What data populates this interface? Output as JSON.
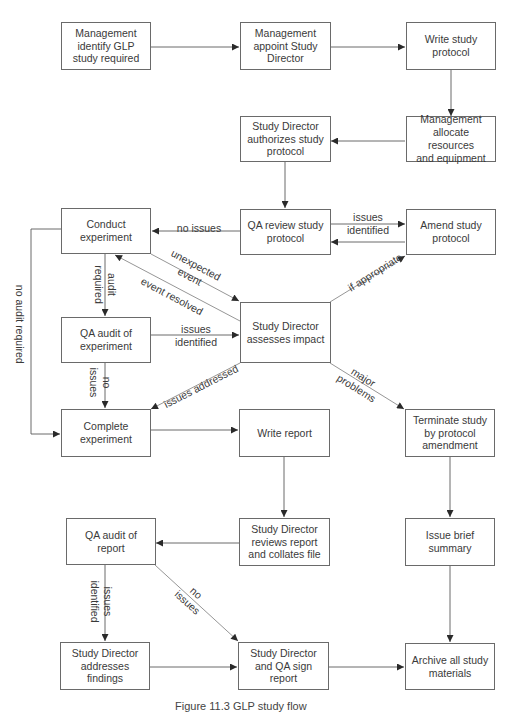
{
  "diagram": {
    "type": "flowchart",
    "title": "GLP study flow",
    "nodes": {
      "mgmt_identify": "Management\nidentify GLP\nstudy required",
      "mgmt_appoint": "Management\nappoint Study\nDirector",
      "write_protocol": "Write study\nprotocol",
      "mgmt_allocate": "Management\nallocate resources\nand equipment",
      "sd_authorizes": "Study Director\nauthorizes study\nprotocol",
      "qa_review": "QA review study\nprotocol",
      "amend_protocol": "Amend study\nprotocol",
      "conduct_experiment": "Conduct\nexperiment",
      "qa_audit_experiment": "QA audit of\nexperiment",
      "sd_assesses": "Study Director\nassesses impact",
      "complete_experiment": "Complete\nexperiment",
      "write_report": "Write report",
      "terminate_study": "Terminate study\nby protocol\namendment",
      "qa_audit_report": "QA audit of\nreport",
      "sd_reviews_report": "Study Director\nreviews report\nand collates file",
      "issue_summary": "Issue brief\nsummary",
      "sd_addresses": "Study Director\naddresses\nfindings",
      "sd_qa_sign": "Study Director\nand QA sign\nreport",
      "archive": "Archive all study\nmaterials"
    },
    "edge_labels": {
      "no_issues_review": "no issues",
      "issues_identified_review": "issues\nidentified",
      "audit_required": "audit\nrequired",
      "no_audit_required": "no audit required",
      "unexpected_event": "unexpected\nevent",
      "event_resolved": "event resolved",
      "if_appropriate": "if appropriate",
      "issues_identified_audit": "issues\nidentified",
      "no_issues_audit": "no\nissues",
      "issues_addressed": "issues addressed",
      "major_problems": "major\nproblems",
      "issues_identified_report": "issues\nidentified",
      "no_issues_report": "no\nissues"
    },
    "edges": [
      {
        "from": "mgmt_identify",
        "to": "mgmt_appoint"
      },
      {
        "from": "mgmt_appoint",
        "to": "write_protocol"
      },
      {
        "from": "write_protocol",
        "to": "mgmt_allocate"
      },
      {
        "from": "mgmt_allocate",
        "to": "sd_authorizes"
      },
      {
        "from": "sd_authorizes",
        "to": "qa_review"
      },
      {
        "from": "qa_review",
        "to": "amend_protocol",
        "label": "issues identified"
      },
      {
        "from": "amend_protocol",
        "to": "qa_review"
      },
      {
        "from": "qa_review",
        "to": "conduct_experiment",
        "label": "no issues"
      },
      {
        "from": "conduct_experiment",
        "to": "qa_audit_experiment",
        "label": "audit required"
      },
      {
        "from": "conduct_experiment",
        "to": "complete_experiment",
        "label": "no audit required"
      },
      {
        "from": "conduct_experiment",
        "to": "sd_assesses",
        "label": "unexpected event"
      },
      {
        "from": "sd_assesses",
        "to": "conduct_experiment",
        "label": "event resolved"
      },
      {
        "from": "sd_assesses",
        "to": "amend_protocol",
        "label": "if appropriate"
      },
      {
        "from": "qa_audit_experiment",
        "to": "sd_assesses",
        "label": "issues identified"
      },
      {
        "from": "qa_audit_experiment",
        "to": "complete_experiment",
        "label": "no issues"
      },
      {
        "from": "sd_assesses",
        "to": "complete_experiment",
        "label": "issues addressed"
      },
      {
        "from": "sd_assesses",
        "to": "terminate_study",
        "label": "major problems"
      },
      {
        "from": "complete_experiment",
        "to": "write_report"
      },
      {
        "from": "write_report",
        "to": "sd_reviews_report"
      },
      {
        "from": "terminate_study",
        "to": "issue_summary"
      },
      {
        "from": "sd_reviews_report",
        "to": "qa_audit_report"
      },
      {
        "from": "qa_audit_report",
        "to": "sd_addresses",
        "label": "issues identified"
      },
      {
        "from": "qa_audit_report",
        "to": "sd_qa_sign",
        "label": "no issues"
      },
      {
        "from": "sd_addresses",
        "to": "sd_qa_sign"
      },
      {
        "from": "sd_qa_sign",
        "to": "archive"
      },
      {
        "from": "issue_summary",
        "to": "archive"
      }
    ],
    "caption": "Figure 11.3   GLP study flow"
  },
  "colors": {
    "line": "#5a5a5a",
    "text": "#3a3a3a",
    "border": "#6a6a6a",
    "background": "#ffffff"
  }
}
